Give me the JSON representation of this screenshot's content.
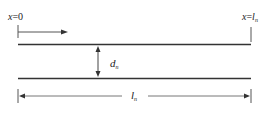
{
  "diagram": {
    "labels": {
      "start": {
        "var": "x",
        "eq": "=0"
      },
      "end": {
        "var": "x",
        "eq": "=",
        "l": "l",
        "sub": "n"
      },
      "gap": {
        "var": "d",
        "sub": "n"
      },
      "length": {
        "var": "l",
        "sub": "n"
      }
    },
    "colors": {
      "line": "#333333",
      "thin": "#555555",
      "dim": "#777777"
    }
  }
}
